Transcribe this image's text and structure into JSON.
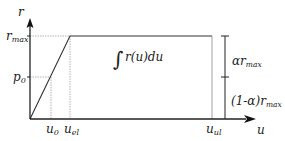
{
  "diagram": {
    "type": "piecewise-curve",
    "axes": {
      "y_label": "r",
      "x_label": "u"
    },
    "y_ticks": [
      {
        "label_main": "r",
        "label_sub": "max",
        "id": "r_max"
      },
      {
        "label_main": "p",
        "label_sub": "0",
        "id": "p_0"
      }
    ],
    "x_ticks": [
      {
        "label_main": "u",
        "label_sub": "0",
        "id": "u_0"
      },
      {
        "label_main": "u",
        "label_sub": "el",
        "id": "u_el"
      },
      {
        "label_main": "u",
        "label_sub": "ul",
        "id": "u_ul"
      }
    ],
    "curve": {
      "points": [
        [
          "0",
          "0"
        ],
        [
          "u_0",
          "p_0"
        ],
        [
          "u_el",
          "r_max"
        ],
        [
          "u_ul",
          "r_max"
        ],
        [
          "u_ul",
          "0"
        ]
      ],
      "description": "linear rise from origin to r_max at u_el, plateau to u_ul, drop to zero"
    },
    "area_label": "∫ r(u)du",
    "area_integral_sign": "∫",
    "area_integrand": "r(u)du",
    "bracket": {
      "upper_main": "αr",
      "upper_sub": "max",
      "lower_main": "(1-α)r",
      "lower_sub": "max"
    },
    "colors": {
      "line": "#222222",
      "guide": "#999999",
      "background": "#ffffff"
    }
  }
}
